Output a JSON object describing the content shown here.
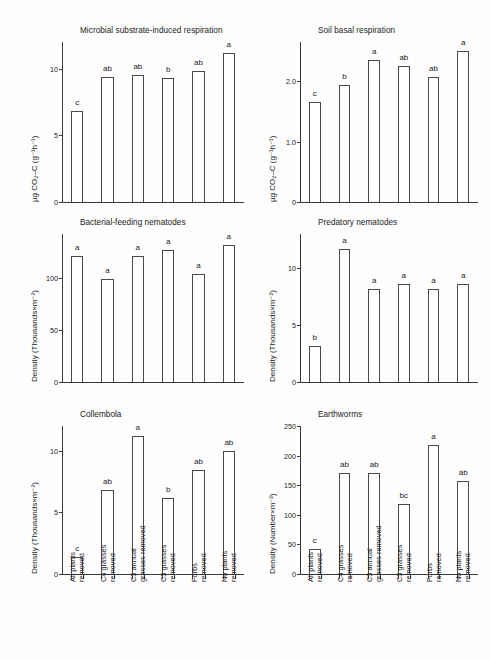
{
  "figure": {
    "categories": [
      "All plants removed",
      "C4 grasses removed",
      "C3 annual grasses removed",
      "C3 grasses removed",
      "Forbs removed",
      "No plants removed"
    ],
    "category_lines": [
      [
        "All plants",
        "removed"
      ],
      [
        "C4 grasses",
        "removed"
      ],
      [
        "C3 annual",
        "grasses removed"
      ],
      [
        "C3 grasses",
        "removed"
      ],
      [
        "Forbs",
        "removed"
      ],
      [
        "No plants",
        "removed"
      ]
    ],
    "bar_color": "#ffffff",
    "bar_edge_color": "#4a4a4a",
    "axis_color": "#3a3a3a"
  },
  "chart_data": [
    {
      "id": "microbial-substrate-induced-respiration",
      "type": "bar",
      "title": "Microbial substrate-induced respiration",
      "ylabel": "µg CO₂–C (g⁻¹h⁻¹)",
      "xlabel": "",
      "categories": [
        "All plants removed",
        "C4 grasses removed",
        "C3 annual grasses removed",
        "C3 grasses removed",
        "Forbs removed",
        "No plants removed"
      ],
      "values": [
        6.8,
        9.4,
        9.5,
        9.3,
        9.8,
        11.2
      ],
      "letters": [
        "c",
        "ab",
        "ab",
        "b",
        "ab",
        "a"
      ],
      "ylim": [
        0,
        12
      ],
      "yticks": [
        0,
        5,
        10
      ],
      "ytick_labels": [
        "0",
        "5",
        "10"
      ],
      "grid": false,
      "legend": "none"
    },
    {
      "id": "soil-basal-respiration",
      "type": "bar",
      "title": "Soil basal respiration",
      "ylabel": "µg CO₂–C (g⁻¹h⁻¹)",
      "xlabel": "",
      "categories": [
        "All plants removed",
        "C4 grasses removed",
        "C3 annual grasses removed",
        "C3 grasses removed",
        "Forbs removed",
        "No plants removed"
      ],
      "values": [
        1.65,
        1.93,
        2.35,
        2.25,
        2.07,
        2.5
      ],
      "letters": [
        "c",
        "b",
        "a",
        "ab",
        "ab",
        "a"
      ],
      "ylim": [
        0,
        2.65
      ],
      "yticks": [
        0,
        1.0,
        2.0
      ],
      "ytick_labels": [
        "0",
        "1.0",
        "2.0"
      ],
      "grid": false,
      "legend": "none"
    },
    {
      "id": "bacterial-feeding-nematodes",
      "type": "bar",
      "title": "Bacterial-feeding nematodes",
      "ylabel": "Density (Thousands×m⁻²)",
      "xlabel": "",
      "categories": [
        "All plants removed",
        "C4 grasses removed",
        "C3 annual grasses removed",
        "C3 grasses removed",
        "Forbs removed",
        "No plants removed"
      ],
      "values": [
        121,
        99,
        121,
        127,
        104,
        131
      ],
      "letters": [
        "a",
        "a",
        "a",
        "a",
        "a",
        "a"
      ],
      "ylim": [
        0,
        142
      ],
      "yticks": [
        0,
        50,
        100
      ],
      "ytick_labels": [
        "0",
        "50",
        "100"
      ],
      "grid": false,
      "legend": "none"
    },
    {
      "id": "predatory-nematodes",
      "type": "bar",
      "title": "Predatory nematodes",
      "ylabel": "Density (Thousands×m⁻²)",
      "xlabel": "",
      "categories": [
        "All plants removed",
        "C4 grasses removed",
        "C3 annual grasses removed",
        "C3 grasses removed",
        "Forbs removed",
        "No plants removed"
      ],
      "values": [
        3.2,
        11.7,
        8.2,
        8.6,
        8.2,
        8.6
      ],
      "letters": [
        "b",
        "a",
        "a",
        "a",
        "a",
        "a"
      ],
      "ylim": [
        0,
        13
      ],
      "yticks": [
        0,
        5,
        10
      ],
      "ytick_labels": [
        "0",
        "5",
        "10"
      ],
      "grid": false,
      "legend": "none"
    },
    {
      "id": "collembola",
      "type": "bar",
      "title": "Collembola",
      "ylabel": "Density (Thousands×m⁻²)",
      "xlabel": "",
      "categories": [
        "All plants removed",
        "C4 grasses removed",
        "C3 annual grasses removed",
        "C3 grasses removed",
        "Forbs removed",
        "No plants removed"
      ],
      "values": [
        1.4,
        6.8,
        11.2,
        6.2,
        8.4,
        10.0
      ],
      "letters": [
        "c",
        "ab",
        "a",
        "b",
        "ab",
        "ab"
      ],
      "ylim": [
        0,
        12
      ],
      "yticks": [
        0,
        5,
        10
      ],
      "ytick_labels": [
        "0",
        "5",
        "10"
      ],
      "grid": false,
      "legend": "none"
    },
    {
      "id": "earthworms",
      "type": "bar",
      "title": "Earthworms",
      "ylabel": "Density (Number×m⁻²)",
      "xlabel": "",
      "categories": [
        "All plants removed",
        "C4 grasses removed",
        "C3 annual grasses removed",
        "C3 grasses removed",
        "Forbs removed",
        "No plants removed"
      ],
      "values": [
        42,
        170,
        170,
        118,
        218,
        157
      ],
      "letters": [
        "c",
        "ab",
        "ab",
        "bc",
        "a",
        "ab"
      ],
      "ylim": [
        0,
        250
      ],
      "yticks": [
        0,
        50,
        100,
        150,
        200,
        250
      ],
      "ytick_labels": [
        "0",
        "50",
        "100",
        "150",
        "200",
        "250"
      ],
      "grid": false,
      "legend": "none"
    }
  ]
}
